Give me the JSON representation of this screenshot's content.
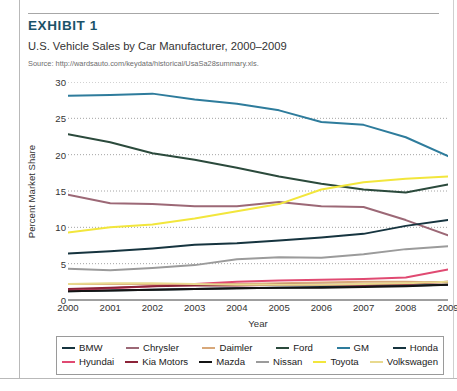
{
  "exhibit": {
    "title": "EXHIBIT 1",
    "subtitle": "U.S. Vehicle Sales by Car Manufacturer, 2000–2009",
    "source": "Source: http://wardsauto.com/keydata/historical/UsaSa28summary.xls.",
    "title_color": "#1b5269"
  },
  "chart_data": {
    "type": "line",
    "title": "U.S. Vehicle Sales by Car Manufacturer, 2000–2009",
    "xlabel": "Year",
    "ylabel": "Percent Market Share",
    "categories": [
      "2000",
      "2001",
      "2002",
      "2003",
      "2004",
      "2005",
      "2006",
      "2007",
      "2008",
      "2009"
    ],
    "x": [
      2000,
      2001,
      2002,
      2003,
      2004,
      2005,
      2006,
      2007,
      2008,
      2009
    ],
    "xlim": [
      2000,
      2009
    ],
    "ylim": [
      0,
      30
    ],
    "yticks": [
      0,
      5,
      10,
      15,
      20,
      25,
      30
    ],
    "xticks": [
      2000,
      2001,
      2002,
      2003,
      2004,
      2005,
      2006,
      2007,
      2008,
      2009
    ],
    "grid": "horizontal-dotted",
    "legend_position": "bottom",
    "series": [
      {
        "name": "BMW",
        "color": "#16343f",
        "values": [
          1.2,
          1.3,
          1.4,
          1.5,
          1.6,
          1.7,
          1.8,
          1.9,
          2.0,
          2.1
        ]
      },
      {
        "name": "Chrysler",
        "color": "#9c6876",
        "values": [
          14.5,
          13.3,
          13.2,
          12.9,
          12.9,
          13.5,
          12.9,
          12.8,
          11.0,
          8.9
        ]
      },
      {
        "name": "Daimler",
        "color": "#d8a87a",
        "values": [
          2.2,
          2.2,
          2.2,
          2.2,
          2.2,
          2.3,
          2.4,
          2.5,
          2.5,
          2.4
        ]
      },
      {
        "name": "Ford",
        "color": "#2b4a3c",
        "values": [
          22.8,
          21.7,
          20.2,
          19.3,
          18.2,
          17.0,
          16.0,
          15.2,
          14.8,
          15.9
        ]
      },
      {
        "name": "GM",
        "color": "#2e7c9c",
        "values": [
          28.1,
          28.2,
          28.4,
          27.6,
          27.0,
          26.1,
          24.5,
          24.1,
          22.4,
          19.8
        ]
      },
      {
        "name": "Honda",
        "color": "#16343f",
        "values": [
          6.4,
          6.7,
          7.1,
          7.6,
          7.8,
          8.2,
          8.6,
          9.1,
          10.2,
          11.0
        ]
      },
      {
        "name": "Hyundai",
        "color": "#e04a72",
        "values": [
          1.3,
          1.6,
          1.9,
          2.2,
          2.5,
          2.7,
          2.8,
          2.9,
          3.1,
          4.2
        ]
      },
      {
        "name": "Kia Motors",
        "color": "#8c2338",
        "values": [
          1.5,
          1.7,
          1.9,
          2.0,
          2.0,
          2.1,
          2.1,
          2.1,
          2.2,
          2.5
        ]
      },
      {
        "name": "Mazda",
        "color": "#141414",
        "values": [
          1.2,
          1.3,
          1.4,
          1.5,
          1.6,
          1.7,
          1.7,
          1.8,
          1.9,
          2.1
        ]
      },
      {
        "name": "Nissan",
        "color": "#9b9b9b",
        "values": [
          4.3,
          4.1,
          4.4,
          4.8,
          5.6,
          5.9,
          5.8,
          6.3,
          7.0,
          7.4
        ]
      },
      {
        "name": "Toyota",
        "color": "#f2e63c",
        "values": [
          9.3,
          10.0,
          10.4,
          11.2,
          12.2,
          13.2,
          15.2,
          16.2,
          16.7,
          17.0
        ]
      },
      {
        "name": "Volkswagen",
        "color": "#e8d98e",
        "values": [
          2.2,
          2.3,
          2.3,
          2.2,
          2.1,
          2.1,
          2.1,
          2.2,
          2.3,
          2.5
        ]
      }
    ]
  },
  "legend": {
    "row1": [
      "BMW",
      "Chrysler",
      "Daimler",
      "Ford",
      "GM",
      "Honda"
    ],
    "row2": [
      "Hyundai",
      "Kia Motors",
      "Mazda",
      "Nissan",
      "Toyota",
      "Volkswagen"
    ]
  }
}
